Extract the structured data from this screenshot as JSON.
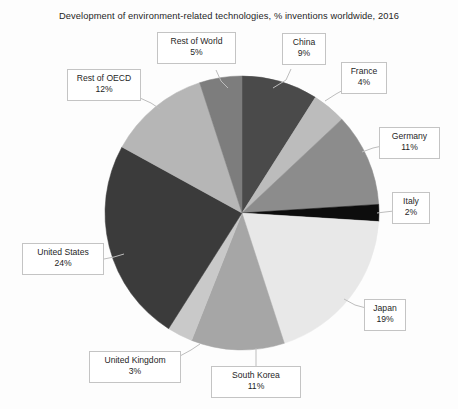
{
  "chart_data": {
    "type": "pie",
    "title": "Development of environment-related technologies, % inventions worldwide, 2016",
    "xlabel": "",
    "ylabel": "",
    "legend": "none",
    "grid": false,
    "unit": "%",
    "categories": [
      "China",
      "France",
      "Germany",
      "Italy",
      "Japan",
      "South Korea",
      "United Kingdom",
      "United States",
      "Rest of OECD",
      "Rest of World"
    ],
    "values": [
      9,
      4,
      11,
      2,
      19,
      11,
      3,
      24,
      12,
      5
    ],
    "slices": [
      {
        "label": "China",
        "value": 9,
        "display": "9%",
        "color": "#4a4a4a",
        "start_angle": 0,
        "end_angle": 32.4
      },
      {
        "label": "France",
        "value": 4,
        "display": "4%",
        "color": "#bcbcbc",
        "start_angle": 32.4,
        "end_angle": 46.8
      },
      {
        "label": "Germany",
        "value": 11,
        "display": "11%",
        "color": "#8c8c8c",
        "start_angle": 46.8,
        "end_angle": 86.4
      },
      {
        "label": "Italy",
        "value": 2,
        "display": "2%",
        "color": "#0d0d0d",
        "start_angle": 86.4,
        "end_angle": 93.6
      },
      {
        "label": "Japan",
        "value": 19,
        "display": "19%",
        "color": "#e8e8e8",
        "start_angle": 93.6,
        "end_angle": 162.0
      },
      {
        "label": "South Korea",
        "value": 11,
        "display": "11%",
        "color": "#a6a6a6",
        "start_angle": 162.0,
        "end_angle": 201.6
      },
      {
        "label": "United Kingdom",
        "value": 3,
        "display": "3%",
        "color": "#c9c9c9",
        "start_angle": 201.6,
        "end_angle": 212.4
      },
      {
        "label": "United States",
        "value": 24,
        "display": "24%",
        "color": "#3b3b3b",
        "start_angle": 212.4,
        "end_angle": 298.8
      },
      {
        "label": "Rest of OECD",
        "value": 12,
        "display": "12%",
        "color": "#b6b6b6",
        "start_angle": 298.8,
        "end_angle": 342.0
      },
      {
        "label": "Rest of World",
        "value": 5,
        "display": "5%",
        "color": "#7d7d7d",
        "start_angle": 342.0,
        "end_angle": 360.0
      }
    ]
  },
  "labels": {
    "rest_of_world": {
      "name": "Rest of World",
      "value": "5%"
    },
    "china": {
      "name": "China",
      "value": "9%"
    },
    "france": {
      "name": "France",
      "value": "4%"
    },
    "germany": {
      "name": "Germany",
      "value": "11%"
    },
    "italy": {
      "name": "Italy",
      "value": "2%"
    },
    "japan": {
      "name": "Japan",
      "value": "19%"
    },
    "south_korea": {
      "name": "South Korea",
      "value": "11%"
    },
    "united_kingdom": {
      "name": "United Kingdom",
      "value": "3%"
    },
    "united_states": {
      "name": "United States",
      "value": "24%"
    },
    "rest_of_oecd": {
      "name": "Rest of OECD",
      "value": "12%"
    }
  }
}
